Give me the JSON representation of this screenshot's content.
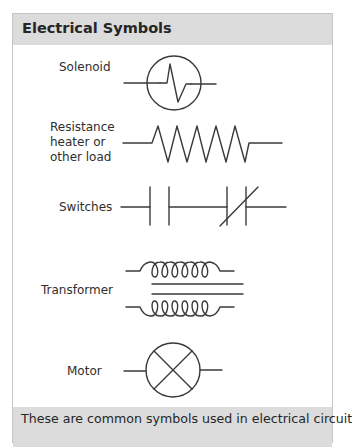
{
  "header": {
    "title": "Electrical Symbols"
  },
  "symbols": [
    {
      "label": "Solenoid",
      "icon": "solenoid-symbol"
    },
    {
      "label": "Resistance\nheater or\nother load",
      "label_lines": [
        "Resistance",
        "heater or",
        "other load"
      ],
      "icon": "resistor-symbol"
    },
    {
      "label": "Switches",
      "icon": "switches-symbol"
    },
    {
      "label": "Transformer",
      "icon": "transformer-symbol"
    },
    {
      "label": "Motor",
      "icon": "motor-symbol"
    }
  ],
  "footer": {
    "caption": "These are common symbols used in electrical circuit"
  },
  "colors": {
    "header_bg": "#dcdcdc",
    "footer_bg": "#dcdcdc",
    "border": "#c4c4c4",
    "line": "#3a3a3a",
    "text": "#262626"
  }
}
